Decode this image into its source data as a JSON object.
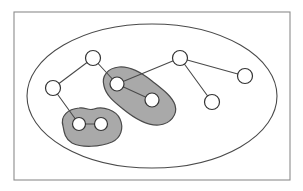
{
  "figure": {
    "width": 303,
    "height": 191,
    "background_color": "#ffffff"
  },
  "frame": {
    "name": "outer-frame",
    "x": 14,
    "y": 12,
    "width": 276,
    "height": 168,
    "stroke_color": "#8c8c8c",
    "fill": "none"
  },
  "universe": {
    "name": "universe-ellipse",
    "cx": 152,
    "cy": 96,
    "rx": 125,
    "ry": 72,
    "stroke_color": "#4a4a4a",
    "fill_color": "#ffffff"
  },
  "colors": {
    "cluster_fill": "#a9a9a9",
    "cluster_stroke": "#4a4a4a",
    "node_fill": "#ffffff",
    "node_stroke": "#333333",
    "edge_stroke": "#4a4a4a",
    "frame_stroke": "#8c8c8c"
  },
  "chart_data": {
    "type": "diagram",
    "subtype": "node-link graph with clustered subsets",
    "node_radius": 7.5,
    "cluster_node_radius": 6.5,
    "nodes": [
      {
        "id": "n1",
        "label": "",
        "x": 53,
        "y": 88,
        "r": 7.5,
        "in_cluster": null
      },
      {
        "id": "n2",
        "label": "",
        "x": 93,
        "y": 58,
        "r": 7.5,
        "in_cluster": null
      },
      {
        "id": "n3",
        "label": "",
        "x": 117,
        "y": 84,
        "r": 7.0,
        "in_cluster": "cluster-b"
      },
      {
        "id": "n4",
        "label": "",
        "x": 152,
        "y": 100,
        "r": 7.0,
        "in_cluster": "cluster-b"
      },
      {
        "id": "n5",
        "label": "",
        "x": 180,
        "y": 58,
        "r": 7.5,
        "in_cluster": null
      },
      {
        "id": "n6",
        "label": "",
        "x": 245,
        "y": 76,
        "r": 7.5,
        "in_cluster": null
      },
      {
        "id": "n7",
        "label": "",
        "x": 212,
        "y": 102,
        "r": 7.5,
        "in_cluster": null
      },
      {
        "id": "n8",
        "label": "",
        "x": 79,
        "y": 124,
        "r": 6.5,
        "in_cluster": "cluster-a"
      },
      {
        "id": "n9",
        "label": "",
        "x": 101,
        "y": 124,
        "r": 6.5,
        "in_cluster": "cluster-a"
      }
    ],
    "edges": [
      {
        "source": "n1",
        "target": "n2"
      },
      {
        "source": "n1",
        "target": "n8"
      },
      {
        "source": "n2",
        "target": "n3"
      },
      {
        "source": "n3",
        "target": "n4"
      },
      {
        "source": "n3",
        "target": "n5"
      },
      {
        "source": "n5",
        "target": "n6"
      },
      {
        "source": "n5",
        "target": "n7"
      },
      {
        "source": "n8",
        "target": "n9"
      }
    ],
    "clusters": [
      {
        "id": "cluster-a",
        "label": "",
        "members": [
          "n8",
          "n9"
        ],
        "fill": "#a9a9a9",
        "stroke": "#4a4a4a",
        "path": "M 63,126 C 60,116 68,109 79,108 C 86,107 88,111 94,109 C 103,106 116,110 120,119 C 124,128 121,138 112,142 C 100,147 82,148 72,143 C 65,139 64,132 63,126 Z"
      },
      {
        "id": "cluster-b",
        "label": "",
        "members": [
          "n3",
          "n4"
        ],
        "fill": "#a9a9a9",
        "stroke": "#4a4a4a",
        "path": "M 104,86 C 101,76 108,68 119,67 C 131,66 142,73 152,81 C 162,89 172,96 175,105 C 178,115 170,124 159,125 C 147,126 134,118 123,109 C 113,101 106,95 104,86 Z"
      }
    ],
    "layout": {
      "coordinate_system": "pixels, origin top-left",
      "axis": "none",
      "grid": false,
      "legend": "none"
    }
  }
}
